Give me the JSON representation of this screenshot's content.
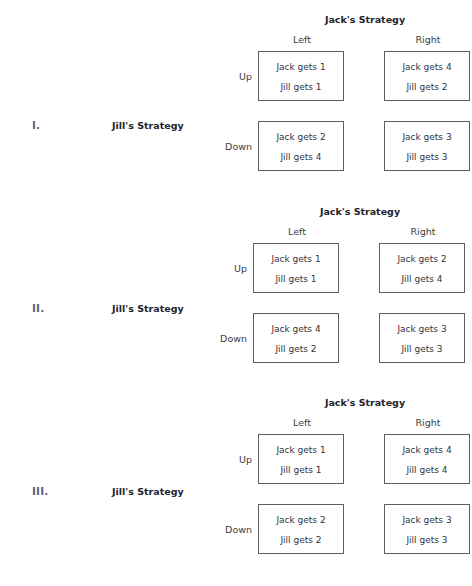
{
  "page": {
    "column_header_title": "Jack's Strategy",
    "row_header_title": "Jill's Strategy",
    "column_labels": [
      "Left",
      "Right"
    ],
    "row_labels": [
      "Up",
      "Down"
    ],
    "roman_color": "#5a6480",
    "border_color": "#5b5b63",
    "text_color": "#33333c",
    "background": "#ffffff"
  },
  "games": [
    {
      "numeral": "I.",
      "jack_strategy_title": "Jack's Strategy",
      "jill_strategy_title": "Jill's Strategy",
      "col_left": "Left",
      "col_right": "Right",
      "row_up": "Up",
      "row_down": "Down",
      "cells": {
        "up_left": {
          "jack": "Jack gets 1",
          "jill": "Jill gets 1"
        },
        "up_right": {
          "jack": "Jack gets 4",
          "jill": "Jill gets 2"
        },
        "down_left": {
          "jack": "Jack gets 2",
          "jill": "Jill gets 4"
        },
        "down_right": {
          "jack": "Jack gets 3",
          "jill": "Jill gets 3"
        }
      }
    },
    {
      "numeral": "II.",
      "jack_strategy_title": "Jack's Strategy",
      "jill_strategy_title": "Jill's Strategy",
      "col_left": "Left",
      "col_right": "Right",
      "row_up": "Up",
      "row_down": "Down",
      "cells": {
        "up_left": {
          "jack": "Jack gets 1",
          "jill": "Jill gets 1"
        },
        "up_right": {
          "jack": "Jack gets 2",
          "jill": "Jill gets 4"
        },
        "down_left": {
          "jack": "Jack gets 4",
          "jill": "Jill gets 2"
        },
        "down_right": {
          "jack": "Jack gets 3",
          "jill": "Jill gets 3"
        }
      }
    },
    {
      "numeral": "III.",
      "jack_strategy_title": "Jack's Strategy",
      "jill_strategy_title": "Jill's Strategy",
      "col_left": "Left",
      "col_right": "Right",
      "row_up": "Up",
      "row_down": "Down",
      "cells": {
        "up_left": {
          "jack": "Jack gets 1",
          "jill": "Jill gets 1"
        },
        "up_right": {
          "jack": "Jack gets 4",
          "jill": "Jill gets 4"
        },
        "down_left": {
          "jack": "Jack gets 2",
          "jill": "Jill gets 2"
        },
        "down_right": {
          "jack": "Jack gets 3",
          "jill": "Jill gets 3"
        }
      }
    }
  ]
}
